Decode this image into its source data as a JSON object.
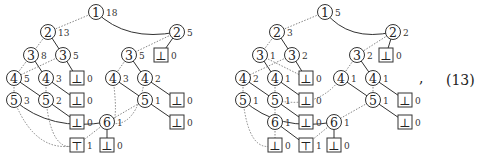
{
  "equation": {
    "comma": ",",
    "number": "(13)"
  },
  "style": {
    "stroke": "#333333",
    "dashed": "#777777",
    "background": "#ffffff"
  },
  "trees": [
    {
      "id": "left",
      "nodes": [
        {
          "id": "a1",
          "kind": "var",
          "label": "1",
          "count": "18",
          "x": 96,
          "y": 12
        },
        {
          "id": "a2",
          "kind": "var",
          "label": "2",
          "count": "13",
          "x": 48,
          "y": 32
        },
        {
          "id": "a3",
          "kind": "var",
          "label": "2",
          "count": "5",
          "x": 177,
          "y": 32
        },
        {
          "id": "a4",
          "kind": "var",
          "label": "3",
          "count": "8",
          "x": 31,
          "y": 55
        },
        {
          "id": "a5",
          "kind": "var",
          "label": "3",
          "count": "5",
          "x": 63,
          "y": 55
        },
        {
          "id": "a6",
          "kind": "var",
          "label": "3",
          "count": "5",
          "x": 129,
          "y": 55
        },
        {
          "id": "a7",
          "kind": "bot",
          "label": "⊥",
          "count": "0",
          "x": 161,
          "y": 55
        },
        {
          "id": "a8",
          "kind": "var",
          "label": "4",
          "count": "5",
          "x": 14,
          "y": 78
        },
        {
          "id": "a9",
          "kind": "var",
          "label": "4",
          "count": "3",
          "x": 46,
          "y": 78
        },
        {
          "id": "a10",
          "kind": "bot",
          "label": "⊥",
          "count": "0",
          "x": 77,
          "y": 78
        },
        {
          "id": "a11",
          "kind": "var",
          "label": "4",
          "count": "3",
          "x": 113,
          "y": 78
        },
        {
          "id": "a12",
          "kind": "var",
          "label": "4",
          "count": "2",
          "x": 145,
          "y": 78
        },
        {
          "id": "a13",
          "kind": "var",
          "label": "5",
          "count": "3",
          "x": 14,
          "y": 100
        },
        {
          "id": "a14",
          "kind": "var",
          "label": "5",
          "count": "2",
          "x": 46,
          "y": 100
        },
        {
          "id": "a15",
          "kind": "bot",
          "label": "⊥",
          "count": "0",
          "x": 77,
          "y": 100
        },
        {
          "id": "a16",
          "kind": "var",
          "label": "5",
          "count": "1",
          "x": 145,
          "y": 100
        },
        {
          "id": "a17",
          "kind": "bot",
          "label": "⊥",
          "count": "0",
          "x": 177,
          "y": 100
        },
        {
          "id": "a18",
          "kind": "bot",
          "label": "⊥",
          "count": "0",
          "x": 77,
          "y": 122
        },
        {
          "id": "a19",
          "kind": "var",
          "label": "6",
          "count": "1",
          "x": 107,
          "y": 122
        },
        {
          "id": "a20",
          "kind": "bot",
          "label": "⊥",
          "count": "0",
          "x": 177,
          "y": 122
        },
        {
          "id": "a21",
          "kind": "top",
          "label": "⊤",
          "count": "1",
          "x": 77,
          "y": 145
        },
        {
          "id": "a22",
          "kind": "bot",
          "label": "⊥",
          "count": "0",
          "x": 107,
          "y": 145
        }
      ],
      "edges": [
        [
          "a1",
          "a2",
          "d"
        ],
        [
          "a1",
          "a3",
          "s"
        ],
        [
          "a2",
          "a4",
          "d"
        ],
        [
          "a2",
          "a5",
          "s"
        ],
        [
          "a3",
          "a6",
          "d"
        ],
        [
          "a3",
          "a7",
          "s"
        ],
        [
          "a4",
          "a8",
          "d"
        ],
        [
          "a4",
          "a9",
          "s"
        ],
        [
          "a5",
          "a8",
          "d"
        ],
        [
          "a5",
          "a10",
          "s"
        ],
        [
          "a6",
          "a11",
          "d"
        ],
        [
          "a6",
          "a12",
          "s"
        ],
        [
          "a8",
          "a13",
          "d"
        ],
        [
          "a8",
          "a14",
          "s"
        ],
        [
          "a9",
          "a14",
          "d"
        ],
        [
          "a9",
          "a15",
          "s"
        ],
        [
          "a11",
          "a19",
          "d"
        ],
        [
          "a11",
          "a16",
          "s"
        ],
        [
          "a12",
          "a19",
          "d"
        ],
        [
          "a12",
          "a17",
          "s"
        ],
        [
          "a13",
          "a21",
          "d"
        ],
        [
          "a13",
          "a19",
          "s"
        ],
        [
          "a14",
          "a21",
          "d"
        ],
        [
          "a14",
          "a18",
          "s"
        ],
        [
          "a16",
          "a19",
          "d"
        ],
        [
          "a16",
          "a20",
          "s"
        ],
        [
          "a19",
          "a21",
          "d"
        ],
        [
          "a19",
          "a22",
          "s"
        ]
      ]
    },
    {
      "id": "right",
      "nodes": [
        {
          "id": "b1",
          "kind": "var",
          "label": "1",
          "count": "5",
          "x": 325,
          "y": 12
        },
        {
          "id": "b2",
          "kind": "var",
          "label": "2",
          "count": "3",
          "x": 277,
          "y": 32
        },
        {
          "id": "b3",
          "kind": "var",
          "label": "2",
          "count": "2",
          "x": 393,
          "y": 32
        },
        {
          "id": "b4",
          "kind": "var",
          "label": "3",
          "count": "1",
          "x": 260,
          "y": 55
        },
        {
          "id": "b5",
          "kind": "var",
          "label": "3",
          "count": "2",
          "x": 292,
          "y": 55
        },
        {
          "id": "b6",
          "kind": "var",
          "label": "3",
          "count": "2",
          "x": 357,
          "y": 55
        },
        {
          "id": "b7",
          "kind": "bot",
          "label": "⊥",
          "count": "0",
          "x": 386,
          "y": 55
        },
        {
          "id": "b8",
          "kind": "var",
          "label": "4",
          "count": "2",
          "x": 243,
          "y": 78
        },
        {
          "id": "b9",
          "kind": "var",
          "label": "4",
          "count": "1",
          "x": 275,
          "y": 78
        },
        {
          "id": "b10",
          "kind": "bot",
          "label": "⊥",
          "count": "0",
          "x": 306,
          "y": 78
        },
        {
          "id": "b11",
          "kind": "var",
          "label": "4",
          "count": "1",
          "x": 341,
          "y": 78
        },
        {
          "id": "b12",
          "kind": "var",
          "label": "4",
          "count": "1",
          "x": 373,
          "y": 78
        },
        {
          "id": "b13",
          "kind": "var",
          "label": "5",
          "count": "1",
          "x": 243,
          "y": 100
        },
        {
          "id": "b14",
          "kind": "var",
          "label": "5",
          "count": "1",
          "x": 275,
          "y": 100
        },
        {
          "id": "b15",
          "kind": "bot",
          "label": "⊥",
          "count": "0",
          "x": 306,
          "y": 100
        },
        {
          "id": "b16",
          "kind": "var",
          "label": "5",
          "count": "1",
          "x": 373,
          "y": 100
        },
        {
          "id": "b17",
          "kind": "bot",
          "label": "⊥",
          "count": "0",
          "x": 405,
          "y": 100
        },
        {
          "id": "b18",
          "kind": "var",
          "label": "6",
          "count": "1",
          "x": 275,
          "y": 122
        },
        {
          "id": "b19",
          "kind": "bot",
          "label": "⊥",
          "count": "0",
          "x": 306,
          "y": 122
        },
        {
          "id": "b20",
          "kind": "var",
          "label": "6",
          "count": "1",
          "x": 334,
          "y": 122
        },
        {
          "id": "b21",
          "kind": "bot",
          "label": "⊥",
          "count": "0",
          "x": 405,
          "y": 122
        },
        {
          "id": "b22",
          "kind": "bot",
          "label": "⊥",
          "count": "0",
          "x": 275,
          "y": 145
        },
        {
          "id": "b23",
          "kind": "top",
          "label": "⊤",
          "count": "1",
          "x": 306,
          "y": 145
        },
        {
          "id": "b24",
          "kind": "bot",
          "label": "⊥",
          "count": "0",
          "x": 334,
          "y": 145
        }
      ],
      "edges": [
        [
          "b1",
          "b2",
          "d"
        ],
        [
          "b1",
          "b3",
          "s"
        ],
        [
          "b2",
          "b4",
          "d"
        ],
        [
          "b2",
          "b5",
          "s"
        ],
        [
          "b3",
          "b6",
          "d"
        ],
        [
          "b3",
          "b7",
          "s"
        ],
        [
          "b4",
          "b9",
          "s"
        ],
        [
          "b4",
          "b10",
          "d"
        ],
        [
          "b5",
          "b8",
          "d"
        ],
        [
          "b5",
          "b10",
          "s"
        ],
        [
          "b6",
          "b11",
          "d"
        ],
        [
          "b6",
          "b12",
          "s"
        ],
        [
          "b8",
          "b13",
          "d"
        ],
        [
          "b8",
          "b14",
          "s"
        ],
        [
          "b9",
          "b14",
          "d"
        ],
        [
          "b9",
          "b15",
          "s"
        ],
        [
          "b11",
          "b14",
          "d"
        ],
        [
          "b11",
          "b16",
          "s"
        ],
        [
          "b12",
          "b16",
          "d"
        ],
        [
          "b12",
          "b17",
          "s"
        ],
        [
          "b13",
          "b22",
          "d"
        ],
        [
          "b13",
          "b20",
          "s"
        ],
        [
          "b14",
          "b18",
          "d"
        ],
        [
          "b14",
          "b19",
          "s"
        ],
        [
          "b16",
          "b20",
          "d"
        ],
        [
          "b16",
          "b21",
          "s"
        ],
        [
          "b18",
          "b22",
          "d"
        ],
        [
          "b18",
          "b23",
          "s"
        ],
        [
          "b20",
          "b23",
          "d"
        ],
        [
          "b20",
          "b24",
          "s"
        ]
      ]
    }
  ]
}
